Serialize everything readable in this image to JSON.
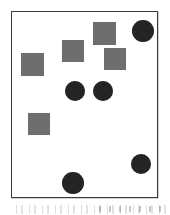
{
  "figure": {
    "title": "Scattered geometric shapes inside a rectangular frame",
    "caption": "",
    "background_color": "#ffffff",
    "frame": {
      "border_color": "#3b3b3b",
      "fill_color": "#ffffff",
      "x": 11,
      "y": 11,
      "width": 147,
      "height": 187
    },
    "square_color": "#6e6e6e",
    "circle_color": "#242424",
    "counts": {
      "squares_label": "squares",
      "squares": 5,
      "circles_label": "circles",
      "circles": 6,
      "total_label": "total shapes",
      "total": 11
    }
  },
  "shapes": [
    {
      "id": "square-1",
      "type": "square",
      "x": 9,
      "y": 41,
      "size": 23,
      "color": "#6e6e6e"
    },
    {
      "id": "square-2",
      "type": "square",
      "x": 50,
      "y": 28,
      "size": 22,
      "color": "#6e6e6e"
    },
    {
      "id": "square-3",
      "type": "square",
      "x": 81,
      "y": 10,
      "size": 23,
      "color": "#6e6e6e"
    },
    {
      "id": "square-4",
      "type": "square",
      "x": 92,
      "y": 36,
      "size": 22,
      "color": "#6e6e6e"
    },
    {
      "id": "square-5",
      "type": "square",
      "x": 16,
      "y": 101,
      "size": 22,
      "color": "#6e6e6e"
    },
    {
      "id": "circle-1",
      "type": "circle",
      "cx": 131,
      "cy": 19,
      "r": 11,
      "color": "#242424"
    },
    {
      "id": "circle-2",
      "type": "circle",
      "cx": 63,
      "cy": 79,
      "r": 10,
      "color": "#242424"
    },
    {
      "id": "circle-3",
      "type": "circle",
      "cx": 91,
      "cy": 79,
      "r": 10,
      "color": "#242424"
    },
    {
      "id": "circle-4",
      "type": "circle",
      "cx": 129,
      "cy": 152,
      "r": 10,
      "color": "#242424"
    },
    {
      "id": "circle-5",
      "type": "circle",
      "cx": 61,
      "cy": 171,
      "r": 11,
      "color": "#242424"
    },
    {
      "id": "circle-6",
      "type": "circle",
      "cx": 131,
      "cy": 19,
      "r": 0,
      "color": "#242424"
    }
  ]
}
